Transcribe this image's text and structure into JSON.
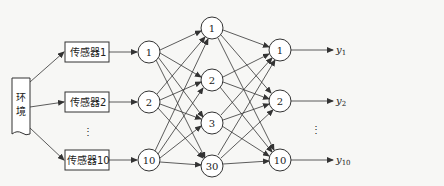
{
  "diagram": {
    "title": "",
    "environment": {
      "label": "环境"
    },
    "sensors": [
      {
        "id": "s1",
        "label": "传感器1"
      },
      {
        "id": "s2",
        "label": "传感器2"
      },
      {
        "id": "s10",
        "label": "传感器10"
      }
    ],
    "input_layer": [
      {
        "id": "i1",
        "label": "1"
      },
      {
        "id": "i2",
        "label": "2"
      },
      {
        "id": "i10",
        "label": "10"
      }
    ],
    "hidden_layer": [
      {
        "id": "h1",
        "label": "1"
      },
      {
        "id": "h2",
        "label": "2"
      },
      {
        "id": "h3",
        "label": "3"
      },
      {
        "id": "h30",
        "label": "30"
      }
    ],
    "output_layer": [
      {
        "id": "o1",
        "label": "1"
      },
      {
        "id": "o2",
        "label": "2"
      },
      {
        "id": "o10",
        "label": "10"
      }
    ],
    "outputs": [
      {
        "id": "y1",
        "label": "y",
        "sub": "1"
      },
      {
        "id": "y2",
        "label": "y",
        "sub": "2"
      },
      {
        "id": "y10",
        "label": "y",
        "sub": "10"
      }
    ],
    "ellipsis": "⋮",
    "connections": "fully connected between adjacent layers"
  }
}
